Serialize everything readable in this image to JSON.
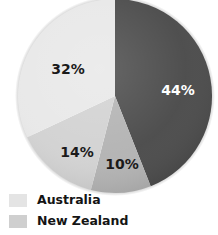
{
  "chart_data": {
    "type": "pie",
    "title": "",
    "subtitle": "",
    "xlabel": "",
    "ylabel": "",
    "grid": false,
    "legend_position": "bottom-left",
    "start_angle_deg": 0,
    "direction": "clockwise",
    "categories": [
      "44%",
      "10%",
      "14%",
      "32%"
    ],
    "values": [
      44,
      10,
      14,
      32
    ],
    "unit": "%",
    "slices": [
      {
        "label": "44%",
        "value": 44,
        "color": "#4a4a4a",
        "label_color": "#ffffff",
        "label_x": 178,
        "label_y": 90
      },
      {
        "label": "10%",
        "value": 10,
        "color": "#b3b3b3",
        "label_color": "#1a1a1a",
        "label_x": 122,
        "label_y": 164
      },
      {
        "label": "14%",
        "value": 14,
        "color": "#d2d2d2",
        "label_color": "#1a1a1a",
        "label_x": 77,
        "label_y": 152
      },
      {
        "label": "32%",
        "value": 32,
        "color": "#e8e8e8",
        "label_color": "#1a1a1a",
        "label_x": 68,
        "label_y": 69
      }
    ],
    "legend": [
      {
        "label": "Australia",
        "color": "#e4e4e4"
      },
      {
        "label": "New Zealand",
        "color": "#cfcfcf"
      }
    ]
  },
  "colors": {
    "background": "#ffffff",
    "slice_darkest": "#4a4a4a",
    "slice_medium": "#b3b3b3",
    "slice_light": "#d2d2d2",
    "slice_lightest": "#e8e8e8",
    "label_dark": "#1a1a1a",
    "label_light": "#ffffff",
    "legend_text": "#141414"
  }
}
